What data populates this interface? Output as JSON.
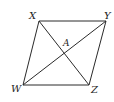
{
  "figure": {
    "type": "parallelogram-with-diagonals",
    "stroke_color": "#2a2a2a",
    "background": "#ffffff",
    "vertices": {
      "X": {
        "label": "X",
        "x": 39,
        "y": 21
      },
      "Y": {
        "label": "Y",
        "x": 106,
        "y": 21
      },
      "W": {
        "label": "W",
        "x": 23,
        "y": 85
      },
      "Z": {
        "label": "Z",
        "x": 89,
        "y": 85
      }
    },
    "intersection": {
      "label": "A",
      "x": 64,
      "y": 53
    },
    "sides": [
      "XY",
      "YZ",
      "ZW",
      "WX"
    ],
    "diagonals": [
      "XZ",
      "WY"
    ]
  }
}
